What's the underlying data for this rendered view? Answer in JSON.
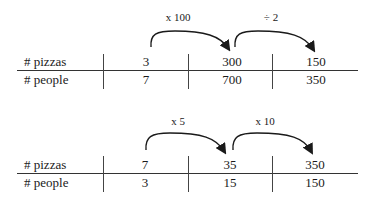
{
  "tables": [
    {
      "row_labels": [
        "# pizzas",
        "# people"
      ],
      "columns": [
        {
          "pizzas": "3",
          "people": "7"
        },
        {
          "pizzas": "300",
          "people": "700"
        },
        {
          "pizzas": "150",
          "people": "350"
        }
      ],
      "arrows": [
        {
          "label": "x 100",
          "from": 0,
          "to": 1
        },
        {
          "label": "÷ 2",
          "from": 1,
          "to": 2
        }
      ]
    },
    {
      "row_labels": [
        "# pizzas",
        "# people"
      ],
      "columns": [
        {
          "pizzas": "7",
          "people": "3"
        },
        {
          "pizzas": "35",
          "people": "15"
        },
        {
          "pizzas": "350",
          "people": "150"
        }
      ],
      "arrows": [
        {
          "label": "x 5",
          "from": 0,
          "to": 1
        },
        {
          "label": "x 10",
          "from": 1,
          "to": 2
        }
      ]
    }
  ]
}
